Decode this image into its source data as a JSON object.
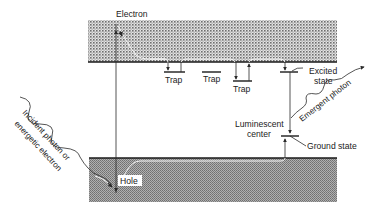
{
  "diagram": {
    "type": "energy band diagram",
    "bands": {
      "conduction": {
        "x": 88,
        "y": 20,
        "width": 249,
        "height": 42
      },
      "valence": {
        "x": 89,
        "y": 158,
        "width": 248,
        "height": 44
      }
    },
    "labels": {
      "electron": "Electron",
      "hole": "Hole",
      "trap1": "Trap",
      "trap2": "Trap",
      "trap3": "Trap",
      "excited_line1": "Excited",
      "excited_line2": "state",
      "ground": "Ground state",
      "lum_line1": "Luminescent",
      "lum_line2": "center",
      "emergent": "Emergent photon",
      "incident_line1": "Incident photon or",
      "incident_line2": "energetic electron"
    },
    "colors": {
      "band_dark": "#8a8a8a",
      "band_light": "#e6e6e6",
      "line": "#2a2a2a"
    }
  }
}
